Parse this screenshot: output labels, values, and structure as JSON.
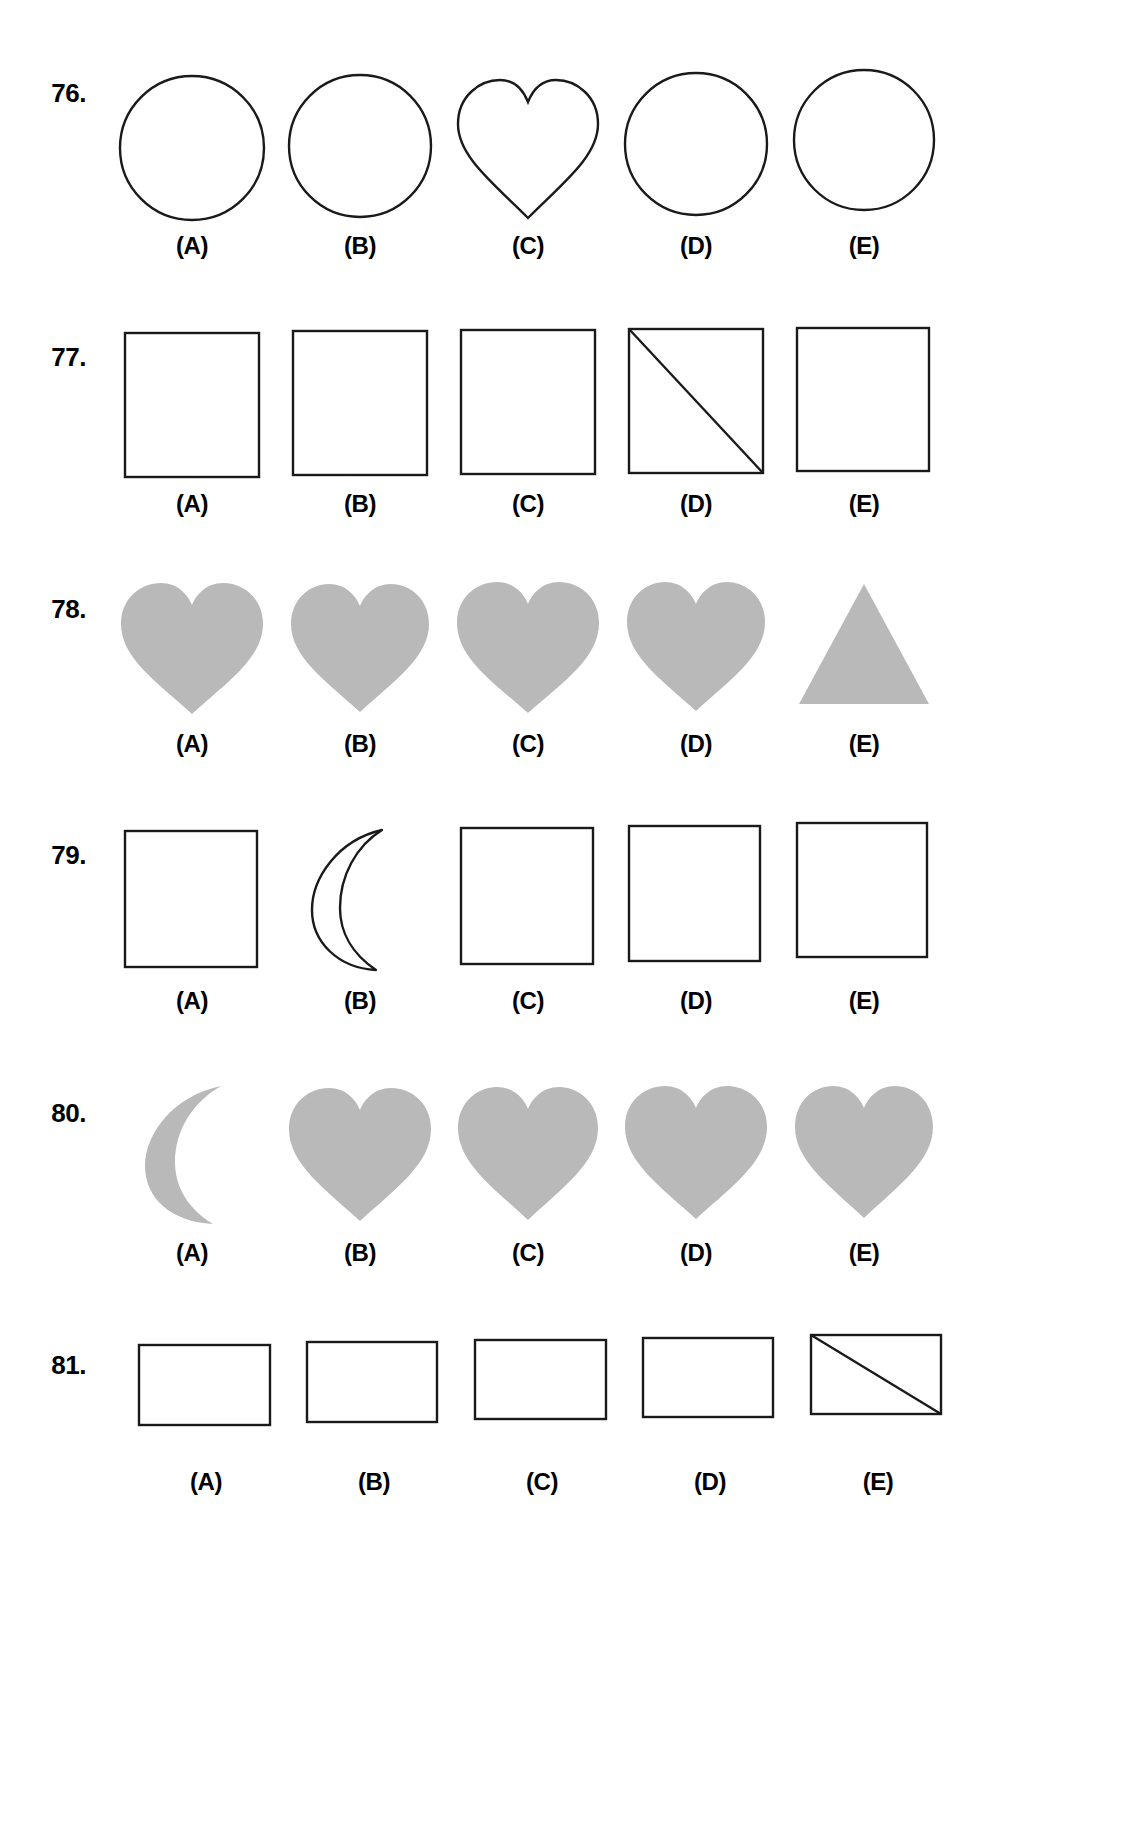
{
  "page": {
    "background_color": "#ffffff",
    "ink_color": "#1a1a1a",
    "fill_gray": "#b9b9b9",
    "stroke_width": 2
  },
  "option_labels": [
    "(A)",
    "(B)",
    "(C)",
    "(D)",
    "(E)"
  ],
  "rows": [
    {
      "number": "76.",
      "style": "outline",
      "options": [
        {
          "label": "(A)",
          "shape": "circle"
        },
        {
          "label": "(B)",
          "shape": "circle"
        },
        {
          "label": "(C)",
          "shape": "heart"
        },
        {
          "label": "(D)",
          "shape": "circle"
        },
        {
          "label": "(E)",
          "shape": "circle"
        }
      ],
      "odd_one_out": "(C)"
    },
    {
      "number": "77.",
      "style": "outline",
      "options": [
        {
          "label": "(A)",
          "shape": "square"
        },
        {
          "label": "(B)",
          "shape": "square"
        },
        {
          "label": "(C)",
          "shape": "square"
        },
        {
          "label": "(D)",
          "shape": "square-with-diagonal"
        },
        {
          "label": "(E)",
          "shape": "square"
        }
      ],
      "odd_one_out": "(D)"
    },
    {
      "number": "78.",
      "style": "filled",
      "options": [
        {
          "label": "(A)",
          "shape": "heart"
        },
        {
          "label": "(B)",
          "shape": "heart"
        },
        {
          "label": "(C)",
          "shape": "heart"
        },
        {
          "label": "(D)",
          "shape": "heart"
        },
        {
          "label": "(E)",
          "shape": "triangle"
        }
      ],
      "odd_one_out": "(E)"
    },
    {
      "number": "79.",
      "style": "outline",
      "options": [
        {
          "label": "(A)",
          "shape": "square"
        },
        {
          "label": "(B)",
          "shape": "crescent"
        },
        {
          "label": "(C)",
          "shape": "square"
        },
        {
          "label": "(D)",
          "shape": "square"
        },
        {
          "label": "(E)",
          "shape": "square"
        }
      ],
      "odd_one_out": "(B)"
    },
    {
      "number": "80.",
      "style": "filled",
      "options": [
        {
          "label": "(A)",
          "shape": "crescent"
        },
        {
          "label": "(B)",
          "shape": "heart"
        },
        {
          "label": "(C)",
          "shape": "heart"
        },
        {
          "label": "(D)",
          "shape": "heart"
        },
        {
          "label": "(E)",
          "shape": "heart"
        }
      ],
      "odd_one_out": "(A)"
    },
    {
      "number": "81.",
      "style": "outline",
      "options": [
        {
          "label": "(A)",
          "shape": "rectangle"
        },
        {
          "label": "(B)",
          "shape": "rectangle"
        },
        {
          "label": "(C)",
          "shape": "rectangle"
        },
        {
          "label": "(D)",
          "shape": "rectangle"
        },
        {
          "label": "(E)",
          "shape": "rectangle-with-diagonal"
        }
      ],
      "odd_one_out": "(E)"
    }
  ]
}
